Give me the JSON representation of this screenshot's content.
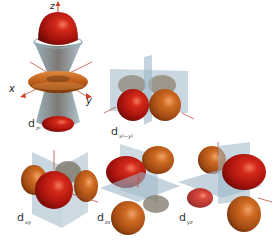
{
  "diagram": {
    "colors": {
      "positive_lobe": "#b5170f",
      "negative_lobe": "#c0621a",
      "nodal_plane": "#9db6c6",
      "axis": "#d0402a",
      "background": "#ffffff"
    },
    "axes": {
      "z": "z",
      "x": "x",
      "y": "y"
    },
    "orbitals": [
      {
        "id": "dz2",
        "base": "d",
        "subscript": "z²"
      },
      {
        "id": "dx2-y2",
        "base": "d",
        "subscript": "x²−y²"
      },
      {
        "id": "dxy",
        "base": "d",
        "subscript": "xy"
      },
      {
        "id": "dzx",
        "base": "d",
        "subscript": "zx"
      },
      {
        "id": "dyz",
        "base": "d",
        "subscript": "yz"
      }
    ]
  }
}
